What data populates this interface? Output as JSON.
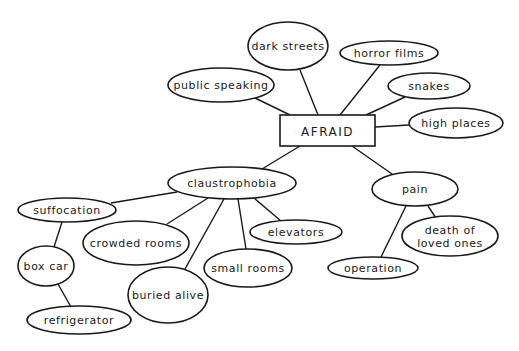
{
  "diagram": {
    "type": "concept-map",
    "center": {
      "id": "afraid",
      "label": "AFRAID",
      "shape": "rectangle",
      "x": 280,
      "y": 115,
      "w": 95,
      "h": 31
    },
    "nodes": [
      {
        "id": "dark-streets",
        "label": "dark streets",
        "cx": 288,
        "cy": 46,
        "rx": 40,
        "ry": 24
      },
      {
        "id": "public-speaking",
        "label": "public speaking",
        "cx": 221,
        "cy": 85,
        "rx": 53,
        "ry": 17
      },
      {
        "id": "horror-films",
        "label": "horror films",
        "cx": 389,
        "cy": 53,
        "rx": 49,
        "ry": 12
      },
      {
        "id": "snakes",
        "label": "snakes",
        "cx": 429,
        "cy": 86,
        "rx": 41,
        "ry": 13
      },
      {
        "id": "high-places",
        "label": "high places",
        "cx": 456,
        "cy": 123,
        "rx": 47,
        "ry": 15
      },
      {
        "id": "claustrophobia",
        "label": "claustrophobia",
        "cx": 232,
        "cy": 183,
        "rx": 64,
        "ry": 16
      },
      {
        "id": "pain",
        "label": "pain",
        "cx": 415,
        "cy": 189,
        "rx": 43,
        "ry": 17
      },
      {
        "id": "death-of-loved-ones",
        "label": "death of",
        "label2": "loved ones",
        "cx": 450,
        "cy": 236,
        "rx": 48,
        "ry": 20
      },
      {
        "id": "operation",
        "label": "operation",
        "cx": 373,
        "cy": 268,
        "rx": 45,
        "ry": 11
      },
      {
        "id": "suffocation",
        "label": "suffocation",
        "cx": 67,
        "cy": 210,
        "rx": 49,
        "ry": 12
      },
      {
        "id": "crowded-rooms",
        "label": "crowded rooms",
        "cx": 136,
        "cy": 243,
        "rx": 53,
        "ry": 22
      },
      {
        "id": "box-car",
        "label": "box car",
        "cx": 46,
        "cy": 266,
        "rx": 28,
        "ry": 20
      },
      {
        "id": "refrigerator",
        "label": "refrigerator",
        "cx": 79,
        "cy": 320,
        "rx": 52,
        "ry": 14
      },
      {
        "id": "buried-alive",
        "label": "buried alive",
        "cx": 168,
        "cy": 295,
        "rx": 40,
        "ry": 28
      },
      {
        "id": "small-rooms",
        "label": "small rooms",
        "cx": 248,
        "cy": 268,
        "rx": 44,
        "ry": 19
      },
      {
        "id": "elevators",
        "label": "elevators",
        "cx": 296,
        "cy": 232,
        "rx": 46,
        "ry": 12
      }
    ],
    "edges": [
      {
        "from": "afraid",
        "to": "public-speaking",
        "x1": 290,
        "y1": 115,
        "x2": 255,
        "y2": 98
      },
      {
        "from": "afraid",
        "to": "dark-streets",
        "x1": 318,
        "y1": 115,
        "x2": 300,
        "y2": 70
      },
      {
        "from": "afraid",
        "to": "horror-films",
        "x1": 340,
        "y1": 115,
        "x2": 380,
        "y2": 65
      },
      {
        "from": "afraid",
        "to": "snakes",
        "x1": 366,
        "y1": 115,
        "x2": 405,
        "y2": 97
      },
      {
        "from": "afraid",
        "to": "high-places",
        "x1": 375,
        "y1": 127,
        "x2": 409,
        "y2": 125
      },
      {
        "from": "afraid",
        "to": "claustrophobia",
        "x1": 300,
        "y1": 146,
        "x2": 262,
        "y2": 169
      },
      {
        "from": "afraid",
        "to": "pain",
        "x1": 352,
        "y1": 146,
        "x2": 392,
        "y2": 174
      },
      {
        "from": "claustrophobia",
        "to": "suffocation",
        "x1": 177,
        "y1": 192,
        "x2": 111,
        "y2": 203
      },
      {
        "from": "claustrophobia",
        "to": "crowded-rooms",
        "x1": 208,
        "y1": 198,
        "x2": 167,
        "y2": 224
      },
      {
        "from": "claustrophobia",
        "to": "buried-alive",
        "x1": 224,
        "y1": 199,
        "x2": 185,
        "y2": 269
      },
      {
        "from": "claustrophobia",
        "to": "small-rooms",
        "x1": 238,
        "y1": 199,
        "x2": 246,
        "y2": 249
      },
      {
        "from": "claustrophobia",
        "to": "elevators",
        "x1": 254,
        "y1": 198,
        "x2": 281,
        "y2": 221
      },
      {
        "from": "suffocation",
        "to": "box-car",
        "x1": 62,
        "y1": 222,
        "x2": 54,
        "y2": 247
      },
      {
        "from": "box-car",
        "to": "refrigerator",
        "x1": 58,
        "y1": 284,
        "x2": 71,
        "y2": 307
      },
      {
        "from": "pain",
        "to": "operation",
        "x1": 406,
        "y1": 206,
        "x2": 381,
        "y2": 257
      },
      {
        "from": "pain",
        "to": "death-of-loved-ones",
        "x1": 428,
        "y1": 206,
        "x2": 436,
        "y2": 218
      }
    ],
    "colors": {
      "stroke": "#1a1a1a",
      "fill": "#ffffff",
      "background": "#ffffff"
    }
  }
}
